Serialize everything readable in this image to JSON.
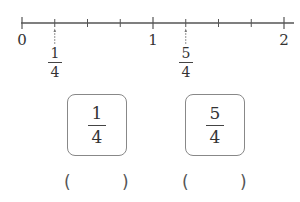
{
  "number_line": {
    "start": 0,
    "end": 2,
    "divisions_per_unit": 4,
    "labels": [
      "0",
      "1",
      "2"
    ],
    "marked_points": [
      {
        "numerator": "1",
        "denominator": "4"
      },
      {
        "numerator": "5",
        "denominator": "4"
      }
    ]
  },
  "boxes": [
    {
      "numerator": "1",
      "denominator": "4",
      "answer_open": "(",
      "answer_close": ")",
      "answer_value": ""
    },
    {
      "numerator": "5",
      "denominator": "4",
      "answer_open": "(",
      "answer_close": ")",
      "answer_value": ""
    }
  ],
  "colors": {
    "line": "#555555",
    "box_border": "#888888",
    "text": "#333333"
  }
}
